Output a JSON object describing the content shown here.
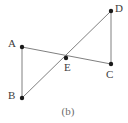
{
  "figure": {
    "caption": "(b)",
    "caption_position": {
      "x": 56,
      "y": 106,
      "width": 24
    },
    "background_color": "#ffffff",
    "line_color": "#808080",
    "line_width": 1,
    "point_color": "#1a1a1a",
    "point_radius": 2.2,
    "label_color": "#3d3d3d",
    "caption_color": "#6b6b6b",
    "points": [
      {
        "id": "A",
        "label": "A",
        "x": 22,
        "y": 47,
        "label_x": 8,
        "label_y": 38
      },
      {
        "id": "B",
        "label": "B",
        "x": 22,
        "y": 98,
        "label_x": 8,
        "label_y": 90
      },
      {
        "id": "C",
        "label": "C",
        "x": 111,
        "y": 64,
        "label_x": 106,
        "label_y": 69
      },
      {
        "id": "D",
        "label": "D",
        "x": 111,
        "y": 11,
        "label_x": 115,
        "label_y": 3
      },
      {
        "id": "E",
        "label": "E",
        "x": 66,
        "y": 58,
        "label_x": 64,
        "label_y": 62
      }
    ],
    "segments": [
      {
        "name": "segment-AB",
        "from": "A",
        "to": "B"
      },
      {
        "name": "segment-AC",
        "from": "A",
        "to": "C"
      },
      {
        "name": "segment-BD",
        "from": "B",
        "to": "D"
      },
      {
        "name": "segment-DC",
        "from": "D",
        "to": "C"
      }
    ]
  }
}
